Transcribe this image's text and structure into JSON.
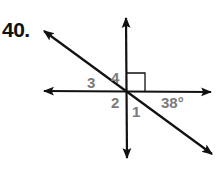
{
  "problem": {
    "number": "40."
  },
  "diagram": {
    "center": [
      126,
      91
    ],
    "colors": {
      "line": "#111111",
      "label": "#7a7a7a"
    },
    "lines": [
      {
        "name": "vertical-line",
        "from": [
          126,
          16
        ],
        "to": [
          127,
          160
        ]
      },
      {
        "name": "horizontal-line",
        "from": [
          42,
          91
        ],
        "to": [
          213,
          92
        ]
      },
      {
        "name": "diagonal-line",
        "from": [
          42,
          30
        ],
        "to": [
          214,
          155
        ]
      }
    ],
    "right_angle_marker": {
      "quadrant": "upper-right",
      "size": 18
    },
    "labels": {
      "angle1": "1",
      "angle2": "2",
      "angle3": "3",
      "angle4": "4",
      "given_angle": "38°"
    }
  }
}
